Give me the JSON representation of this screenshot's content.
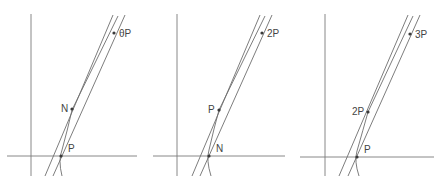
{
  "colors": {
    "line": "#6e6e6e",
    "axis": "#7a7a7a",
    "point": "#3a3a3a",
    "text": "#444444"
  },
  "panels": [
    {
      "id": "panel-1",
      "vaxis": {
        "x": 31,
        "y1": 14,
        "y2": 176
      },
      "haxis": {
        "y": 156,
        "x1": 7,
        "x2": 137
      },
      "lines": [
        {
          "x1": 45,
          "y1": 176,
          "x2": 113,
          "y2": 15
        },
        {
          "x1": 53,
          "y1": 176,
          "x2": 125,
          "y2": 15
        }
      ],
      "curve": "M 62 176 Q 58 160 62 150 Q 68 128 72 110 L 118 16",
      "points": [
        {
          "label": "θP",
          "x": 114,
          "y": 33,
          "lx": 119,
          "ly": 37
        },
        {
          "label": "N",
          "x": 72,
          "y": 109,
          "lx": 61,
          "ly": 112
        },
        {
          "label": "P",
          "x": 61,
          "y": 156,
          "lx": 68,
          "ly": 152
        }
      ]
    },
    {
      "id": "panel-2",
      "vaxis": {
        "x": 177,
        "y1": 14,
        "y2": 176
      },
      "haxis": {
        "y": 156,
        "x1": 153,
        "x2": 285
      },
      "lines": [
        {
          "x1": 192,
          "y1": 176,
          "x2": 260,
          "y2": 15
        },
        {
          "x1": 200,
          "y1": 176,
          "x2": 272,
          "y2": 15
        }
      ],
      "curve": "M 211 176 Q 206 160 209 150 Q 214 128 219 110 L 265 16",
      "points": [
        {
          "label": "2P",
          "x": 262,
          "y": 33,
          "lx": 267,
          "ly": 37
        },
        {
          "label": "P",
          "x": 219,
          "y": 110,
          "lx": 208,
          "ly": 113
        },
        {
          "label": "N",
          "x": 209,
          "y": 156,
          "lx": 216,
          "ly": 152
        }
      ]
    },
    {
      "id": "panel-3",
      "vaxis": {
        "x": 325,
        "y1": 14,
        "y2": 176
      },
      "haxis": {
        "y": 157,
        "x1": 300,
        "x2": 434
      },
      "lines": [
        {
          "x1": 339,
          "y1": 176,
          "x2": 408,
          "y2": 15
        },
        {
          "x1": 348,
          "y1": 176,
          "x2": 420,
          "y2": 15
        }
      ],
      "curve": "M 359 176 Q 354 161 357 151 Q 363 130 368 112 L 413 16",
      "points": [
        {
          "label": "3P",
          "x": 410,
          "y": 34,
          "lx": 415,
          "ly": 38
        },
        {
          "label": "2P",
          "x": 368,
          "y": 112,
          "lx": 352,
          "ly": 115
        },
        {
          "label": "P",
          "x": 357,
          "y": 157,
          "lx": 364,
          "ly": 153
        }
      ]
    }
  ]
}
